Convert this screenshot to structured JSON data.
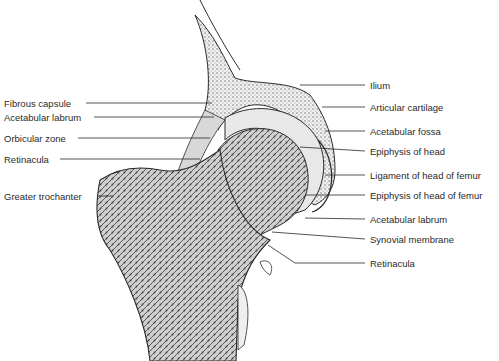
{
  "figure": {
    "colors": {
      "ink": "#2a2a2a",
      "bone_fill": "#f2f2f2",
      "cancellous": "#8a8a8a",
      "background": "#ffffff"
    }
  },
  "labels_left": [
    {
      "text": "Fibrous capsule",
      "x": 4,
      "y": 98
    },
    {
      "text": "Acetabular labrum",
      "x": 4,
      "y": 112
    },
    {
      "text": "Orbicular zone",
      "x": 4,
      "y": 133
    },
    {
      "text": "Retinacula",
      "x": 4,
      "y": 154
    },
    {
      "text": "Greater trochanter",
      "x": 4,
      "y": 191
    }
  ],
  "labels_right": [
    {
      "text": "Ilium",
      "x": 370,
      "y": 80
    },
    {
      "text": "Articular cartilage",
      "x": 370,
      "y": 102
    },
    {
      "text": "Acetabular fossa",
      "x": 370,
      "y": 126
    },
    {
      "text": "Epiphysis of head",
      "x": 370,
      "y": 146
    },
    {
      "text": "Ligament of head of femur",
      "x": 370,
      "y": 170
    },
    {
      "text": "Epiphysis of head of femur",
      "x": 370,
      "y": 190
    },
    {
      "text": "Acetabular labrum",
      "x": 370,
      "y": 214
    },
    {
      "text": "Synovial membrane",
      "x": 370,
      "y": 234
    },
    {
      "text": "Retinacula",
      "x": 370,
      "y": 258
    }
  ]
}
